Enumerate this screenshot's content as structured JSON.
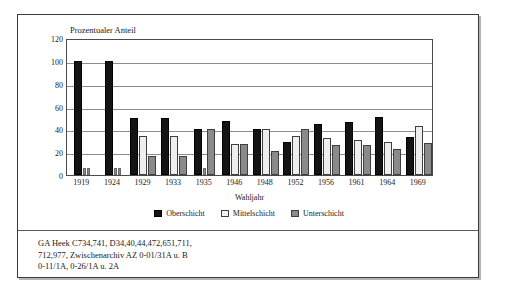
{
  "figure": {
    "yaxis_title": "Prozentualer Anteil",
    "xaxis_title": "Wahljahr"
  },
  "legend": {
    "items": [
      {
        "label": "Oberschicht",
        "swatch": "dark-filled-square-icon"
      },
      {
        "label": "Mittelschicht",
        "swatch": "light-outlined-square-icon"
      },
      {
        "label": "Unterschicht",
        "swatch": "gray-filled-square-icon"
      }
    ]
  },
  "source_note": {
    "lines": [
      "GA Heek C734,741, D34,40,44,472,651,711,",
      "712,977, Zwischenarchiv AZ 0-01/31A u. B",
      "0-11/1A, 0-26/1A u. 2A"
    ]
  },
  "colors": {
    "series_oberschicht": "#141414",
    "series_mittelschicht": "#eeeeee",
    "series_unterschicht": "#8a8a8a",
    "frame": "#3a3a3a",
    "gridline": "#8d8d8d"
  },
  "chart_data": {
    "type": "bar",
    "title": "",
    "xlabel": "Wahljahr",
    "ylabel": "Prozentualer Anteil",
    "ylim": [
      0,
      120
    ],
    "yticks": [
      0,
      20,
      40,
      60,
      80,
      100,
      120
    ],
    "grid": true,
    "legend_position": "bottom-center",
    "categories": [
      "1919",
      "1924",
      "1929",
      "1933",
      "1935",
      "1946",
      "1948",
      "1952",
      "1956",
      "1961",
      "1964",
      "1969"
    ],
    "series": [
      {
        "name": "Oberschicht",
        "values": [
          100,
          100,
          50,
          50,
          40,
          47,
          40,
          29,
          45,
          46,
          51,
          33
        ]
      },
      {
        "name": "Mittelschicht",
        "values": [
          0,
          0,
          34,
          34,
          0,
          27,
          40,
          34,
          32,
          31,
          29,
          43
        ]
      },
      {
        "name": "Unterschicht",
        "values": [
          0,
          0,
          17,
          17,
          40,
          27,
          21,
          40,
          26,
          26,
          23,
          28
        ]
      }
    ]
  }
}
